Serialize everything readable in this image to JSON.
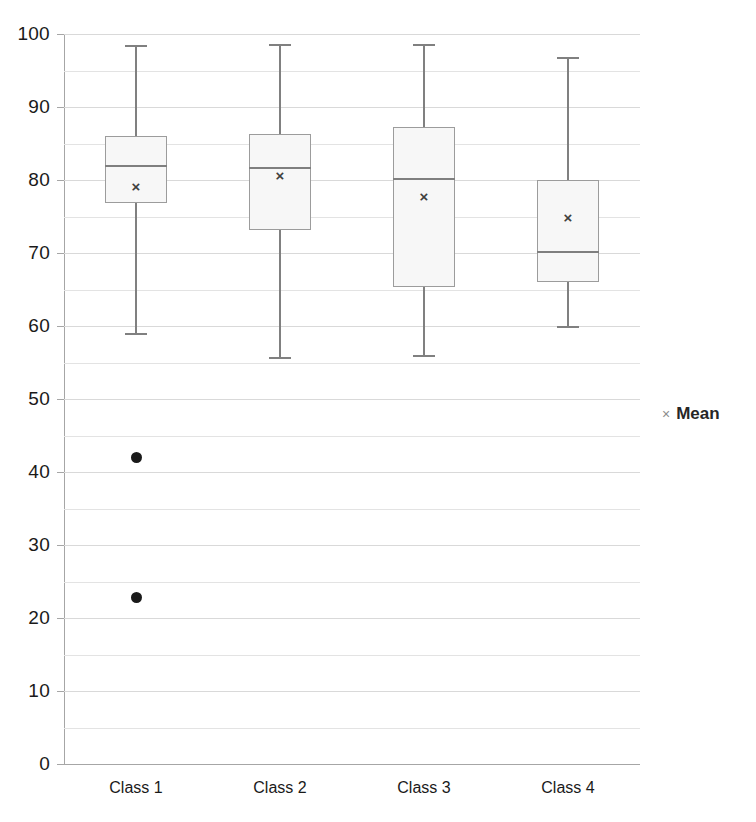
{
  "chart": {
    "title": "",
    "legend": {
      "marker": "×",
      "label": "Mean",
      "position": "right"
    }
  },
  "chart_data": {
    "type": "box",
    "title": "",
    "xlabel": "",
    "ylabel": "",
    "ylim": [
      0,
      100
    ],
    "y_major_step": 10,
    "y_minor_step": 5,
    "grid": true,
    "categories": [
      "Class 1",
      "Class 2",
      "Class 3",
      "Class 4"
    ],
    "y_ticks": [
      0,
      10,
      20,
      30,
      40,
      50,
      60,
      70,
      80,
      90,
      100
    ],
    "y_tick_labels": [
      "0",
      "10",
      "20",
      "30",
      "40",
      "50",
      "60",
      "70",
      "80",
      "90",
      "100"
    ],
    "series": [
      {
        "name": "Class 1",
        "whisker_low": 59,
        "q1": 76.8,
        "median": 82,
        "q3": 86,
        "whisker_high": 98.5,
        "mean": 77.9,
        "outliers": [
          42,
          22.8
        ]
      },
      {
        "name": "Class 2",
        "whisker_low": 55.8,
        "q1": 73.2,
        "median": 81.8,
        "q3": 86.3,
        "whisker_high": 98.6,
        "mean": 79.4,
        "outliers": []
      },
      {
        "name": "Class 3",
        "whisker_low": 56,
        "q1": 65.4,
        "median": 80.3,
        "q3": 87.2,
        "whisker_high": 98.6,
        "mean": 76.6,
        "outliers": []
      },
      {
        "name": "Class 4",
        "whisker_low": 60,
        "q1": 66,
        "median": 70.3,
        "q3": 80,
        "whisker_high": 96.8,
        "mean": 73.7,
        "outliers": []
      }
    ],
    "legend": [
      "Mean"
    ]
  }
}
